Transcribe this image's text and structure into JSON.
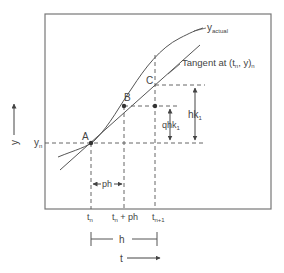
{
  "diagram": {
    "colors": {
      "stroke": "#555555",
      "frame": "#777777",
      "text": "#444444",
      "background": "#ffffff"
    },
    "curves": {
      "actual": {
        "label_main": "y",
        "label_sub": "actual"
      },
      "tangent": {
        "label_main": "Tangent at (t",
        "label_sub1": "n",
        "label_mid": ", y)",
        "label_sub2": "n"
      }
    },
    "points": {
      "A": {
        "label": "A"
      },
      "B": {
        "label": "B"
      },
      "C": {
        "label": "C"
      }
    },
    "y_axis": {
      "label": "y",
      "value_label_main": "y",
      "value_label_sub": "n"
    },
    "x_axis": {
      "label": "t",
      "ticks": [
        {
          "main": "t",
          "sub": "n"
        },
        {
          "main": "t",
          "sub": "n",
          "rest": " + ph"
        },
        {
          "main": "t",
          "sub": "n+1"
        }
      ]
    },
    "dimensions": {
      "ph": "ph",
      "h": "h",
      "hk1_main": "hk",
      "hk1_sub": "1",
      "qhk1_main": "qhk",
      "qhk1_sub": "1"
    }
  }
}
